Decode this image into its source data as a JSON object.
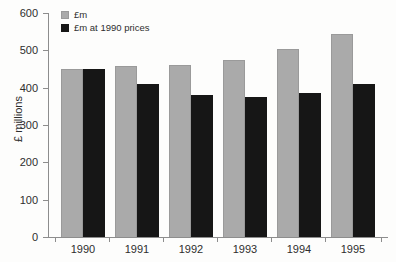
{
  "chart_data": {
    "type": "bar",
    "title": "",
    "xlabel": "",
    "ylabel": "£ millions",
    "categories": [
      "1990",
      "1991",
      "1992",
      "1993",
      "1994",
      "1995"
    ],
    "series": [
      {
        "name": "£m",
        "color": "#aaaaaa",
        "values": [
          450,
          458,
          460,
          475,
          503,
          545
        ]
      },
      {
        "name": "£m at 1990 prices",
        "color": "#161616",
        "values": [
          450,
          410,
          380,
          376,
          385,
          410
        ]
      }
    ],
    "ylim": [
      0,
      600
    ],
    "yticks": [
      0,
      100,
      200,
      300,
      400,
      500,
      600
    ],
    "ytick_labels": [
      "0",
      "100",
      "200",
      "300",
      "400",
      "500",
      "600"
    ],
    "grid": false,
    "legend_position": "top-left"
  }
}
